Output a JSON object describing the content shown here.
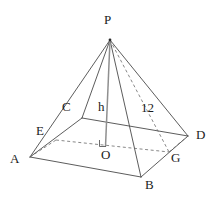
{
  "figure": {
    "type": "geometry-diagram",
    "stroke_color": "#4a4a4a",
    "label_color": "#1b1b1b",
    "background_color": "#ffffff",
    "canvas": {
      "width": 219,
      "height": 200
    },
    "vertices": [
      {
        "id": "P",
        "label": "P",
        "x": 110,
        "y": 40,
        "label_x": 104,
        "label_y": 13,
        "kind": "apex"
      },
      {
        "id": "A",
        "label": "A",
        "x": 30,
        "y": 157,
        "label_x": 10,
        "label_y": 152,
        "kind": "base-corner"
      },
      {
        "id": "B",
        "label": "B",
        "x": 141,
        "y": 177,
        "label_x": 145,
        "label_y": 178,
        "kind": "base-corner"
      },
      {
        "id": "D",
        "label": "D",
        "x": 188,
        "y": 136,
        "label_x": 196,
        "label_y": 128,
        "kind": "base-corner"
      },
      {
        "id": "G",
        "label": "G",
        "x": 169,
        "y": 152,
        "label_x": 171,
        "label_y": 151,
        "kind": "base-corner-hidden"
      },
      {
        "id": "E",
        "label": "E",
        "x": 56,
        "y": 140,
        "label_x": 36,
        "label_y": 124,
        "kind": "mid-edge"
      },
      {
        "id": "C",
        "label": "C",
        "x": 82,
        "y": 118,
        "label_x": 62,
        "label_y": 100,
        "kind": "mid-edge"
      },
      {
        "id": "O",
        "label": "O",
        "x": 105,
        "y": 146,
        "label_x": 101,
        "label_y": 148,
        "kind": "base-center"
      }
    ],
    "measure_labels": [
      {
        "id": "h",
        "label": "h",
        "x": 98,
        "y": 100,
        "meaning": "pyramid-height"
      },
      {
        "id": "slant",
        "label": "12",
        "x": 141,
        "y": 101,
        "meaning": "slant-edge-length"
      }
    ],
    "edges_solid": [
      {
        "name": "edge-P-A",
        "from": "P",
        "to": "A"
      },
      {
        "name": "edge-P-B",
        "from": "P",
        "to": "B"
      },
      {
        "name": "edge-P-D",
        "from": "P",
        "to": "D"
      },
      {
        "name": "edge-P-C",
        "from": "P",
        "to": "C"
      },
      {
        "name": "edge-A-B",
        "from": "A",
        "to": "B"
      },
      {
        "name": "edge-B-D",
        "from": "B",
        "to": "D"
      },
      {
        "name": "edge-A-C",
        "from": "A",
        "to": "C"
      },
      {
        "name": "edge-C-D",
        "from": "C",
        "to": "D"
      }
    ],
    "edges_dashed": [
      {
        "name": "edge-P-G-hidden",
        "from": "P",
        "to": "G"
      },
      {
        "name": "edge-E-G-hidden",
        "from": "E",
        "to": "G"
      },
      {
        "name": "edge-G-D-hidden",
        "from": "G",
        "to": "D"
      },
      {
        "name": "edge-A-E-hidden",
        "from": "A",
        "to": "E"
      }
    ],
    "height_segment": {
      "name": "height-line-P-O",
      "from": "P",
      "to": "O"
    },
    "right_angle_marker": {
      "name": "right-angle-at-O",
      "x": 105,
      "y": 146,
      "size": 6
    }
  }
}
